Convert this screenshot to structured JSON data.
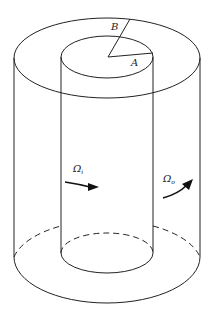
{
  "diagram": {
    "type": "taylor-couette-coaxial-cylinders",
    "labels": {
      "radius_outer": "B",
      "radius_inner": "A",
      "omega_inner": "Ω",
      "omega_inner_sub": "i",
      "omega_outer": "Ω",
      "omega_outer_sub": "o"
    },
    "colors": {
      "stroke": "#222222",
      "background": "#ffffff"
    }
  }
}
